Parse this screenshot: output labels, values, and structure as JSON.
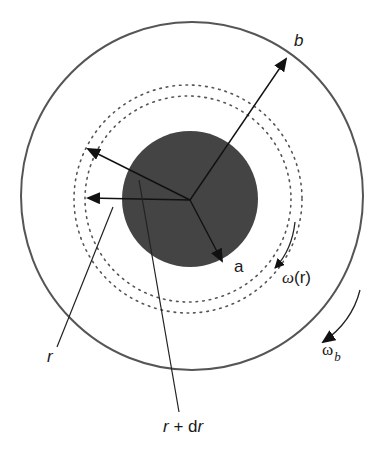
{
  "diagram": {
    "colors": {
      "outer_circle": "#555555",
      "core_fill": "#444444",
      "dotted_rings": "#555555",
      "arrows": "#111111",
      "background": "#ffffff"
    },
    "shapes": {
      "outer_circle": {
        "cx": 192,
        "cy": 196,
        "r": 171
      },
      "inner_core": {
        "cx": 190,
        "cy": 199,
        "r": 68
      },
      "dotted_ring_inner": {
        "cx": 188,
        "cy": 199,
        "r": 103
      },
      "dotted_ring_outer": {
        "cx": 188,
        "cy": 199,
        "r": 114
      },
      "origin": {
        "x": 190,
        "y": 200
      }
    },
    "labels": {
      "b": "b",
      "a": "a",
      "omega_r": "ω(r)",
      "omega_r_symbol": "ω",
      "omega_r_arg": "(r)",
      "omega_b_symbol": "ω",
      "omega_b_sub": "b",
      "r": "r",
      "r_plus_dr": "r + dr",
      "r_plus_dr_r1": "r",
      "r_plus_dr_plus": " + d",
      "r_plus_dr_r2": "r"
    },
    "arrows": [
      {
        "name": "radius-b",
        "from": [
          190,
          200
        ],
        "to": [
          287,
          58
        ]
      },
      {
        "name": "radius-a",
        "from": [
          190,
          200
        ],
        "to": [
          223,
          262
        ]
      },
      {
        "name": "radius-r-plus-dr",
        "from": [
          190,
          200
        ],
        "to": [
          87,
          148
        ]
      },
      {
        "name": "radius-r",
        "from": [
          190,
          200
        ],
        "to": [
          87,
          198
        ]
      }
    ],
    "leaders": [
      {
        "name": "r-leader",
        "from": [
          113,
          207
        ],
        "to": [
          57,
          347
        ]
      },
      {
        "name": "r-plus-dr-leader",
        "from": [
          139,
          180
        ],
        "to": [
          179,
          412
        ]
      }
    ],
    "rotation_arrows": [
      {
        "name": "omega-r",
        "label": "ω(r)"
      },
      {
        "name": "omega-b",
        "label": "ωb"
      }
    ]
  }
}
